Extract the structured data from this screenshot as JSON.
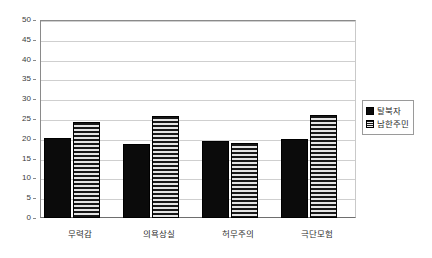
{
  "chart_data": {
    "type": "bar",
    "title": "",
    "subtitle": "",
    "xlabel": "",
    "ylabel": "",
    "categories": [
      "무력감",
      "의욕상실",
      "허무주의",
      "극단모험"
    ],
    "series": [
      {
        "name": "탈북자",
        "values": [
          20.3,
          18.6,
          19.5,
          20.0
        ],
        "pattern": "solid-black",
        "color": "#0b0b0b"
      },
      {
        "name": "남한주민",
        "values": [
          24.3,
          25.7,
          18.9,
          26.0
        ],
        "pattern": "horizontal-stripes",
        "color": "#d9d9d9"
      }
    ],
    "ylim": [
      0,
      50
    ],
    "ytick_step": 5,
    "ytick_labels": [
      "0",
      "5",
      "10",
      "15",
      "20",
      "25",
      "30",
      "35",
      "40",
      "45",
      "50"
    ],
    "grid": true,
    "grid_axis": "y",
    "legend_position": "right",
    "axis_color": "#8a8a8a",
    "grid_color": "#cfcfcf",
    "background": "#ffffff"
  },
  "legend": {
    "items": [
      {
        "label": "탈북자"
      },
      {
        "label": "남한주민"
      }
    ]
  }
}
